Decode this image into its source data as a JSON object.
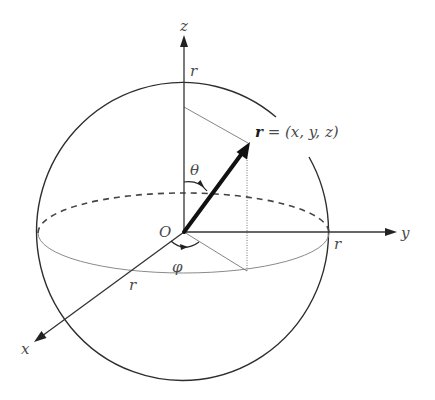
{
  "diagram": {
    "axes": {
      "x_label": "x",
      "y_label": "y",
      "z_label": "z"
    },
    "origin_label": "O",
    "radius_labels": {
      "on_z_axis": "r",
      "on_y_axis": "r",
      "on_x_axis": "r"
    },
    "angles": {
      "polar": "θ",
      "azimuthal": "φ"
    },
    "position_vector": {
      "symbol": "r",
      "equation": " = (x, y, z)"
    },
    "colors": {
      "lines": "#333333",
      "vector": "#111111",
      "text": "#4a4a4a",
      "equator_front": "#8a8a8a"
    }
  }
}
